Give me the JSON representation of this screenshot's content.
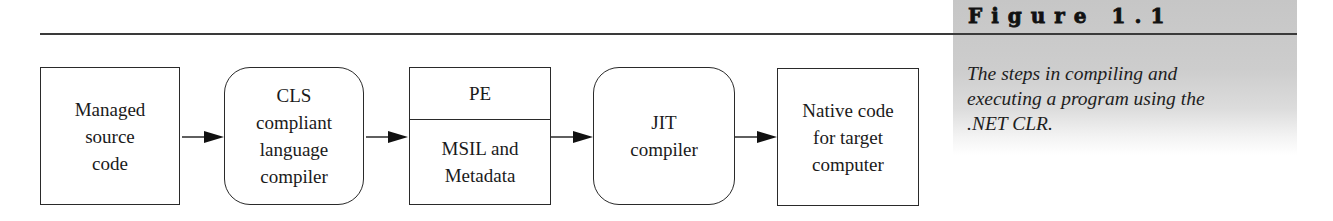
{
  "figure": {
    "title": "Figure 1.1",
    "caption_lines": [
      "The steps in compiling and",
      "executing a program using the",
      ".NET CLR."
    ]
  },
  "diagram": {
    "nodes": [
      {
        "id": "managed-source",
        "shape": "rectangle",
        "lines": [
          "Managed",
          "source",
          "code"
        ]
      },
      {
        "id": "cls-compiler",
        "shape": "rounded-rectangle",
        "lines": [
          "CLS",
          "compliant",
          "language",
          "compiler"
        ]
      },
      {
        "id": "pe",
        "shape": "split-rectangle",
        "header": "PE",
        "lines": [
          "MSIL and",
          "Metadata"
        ]
      },
      {
        "id": "jit-compiler",
        "shape": "rounded-rectangle",
        "lines": [
          "JIT",
          "compiler"
        ]
      },
      {
        "id": "native-code",
        "shape": "rectangle",
        "lines": [
          "Native code",
          "for target",
          "computer"
        ]
      }
    ],
    "edges": [
      {
        "from": "managed-source",
        "to": "cls-compiler"
      },
      {
        "from": "cls-compiler",
        "to": "pe"
      },
      {
        "from": "pe",
        "to": "jit-compiler"
      },
      {
        "from": "jit-compiler",
        "to": "native-code"
      }
    ]
  },
  "colors": {
    "stroke": "#2a2a2a",
    "panel_gray": "#c6c6c6",
    "text": "#1a1a1a"
  }
}
